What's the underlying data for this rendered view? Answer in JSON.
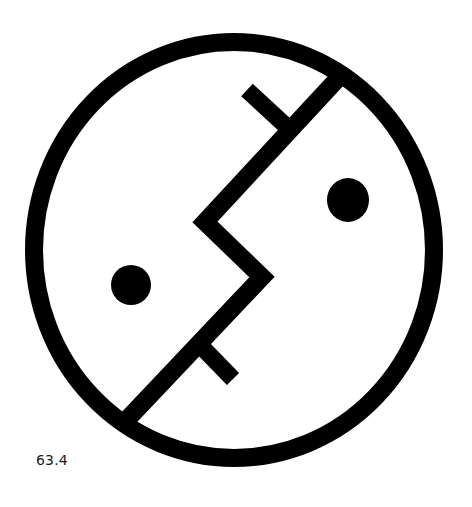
{
  "figure": {
    "caption": "63.4",
    "ink_color": "#000000",
    "background_color": "#ffffff",
    "elements": {
      "outer_circle": {
        "cx": 234,
        "cy": 250,
        "rx": 200,
        "ry": 208,
        "stroke_width": 18
      },
      "dividing_line": {
        "points": "133,413 262,277 205,222 343,72",
        "stroke_width": 18
      },
      "upper_branch": {
        "x1": 283,
        "y1": 123,
        "x2": 247,
        "y2": 91,
        "stroke_width": 17
      },
      "lower_branch": {
        "x1": 200,
        "y1": 345,
        "x2": 232,
        "y2": 378,
        "stroke_width": 17
      },
      "left_eye": {
        "cx": 131,
        "cy": 285,
        "r": 20
      },
      "right_eye": {
        "cx": 348,
        "cy": 200,
        "rx": 21,
        "ry": 22
      }
    }
  }
}
